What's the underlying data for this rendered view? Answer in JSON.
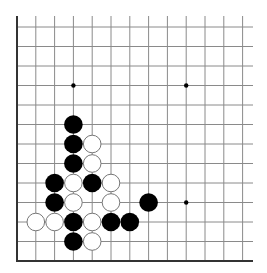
{
  "board": {
    "type": "go-board-fragment",
    "visible_columns": 13,
    "visible_rows": 13,
    "edges": [
      "left",
      "bottom"
    ],
    "origin": "bottom-left",
    "colors": {
      "background": "#ffffff",
      "grid_line": "#8a8a8a",
      "edge_line": "#333333",
      "black_stone": "#000000",
      "white_stone_fill": "#ffffff",
      "white_stone_stroke": "#777777",
      "star_point": "#000000"
    },
    "star_points": [
      {
        "col": 3,
        "row": 9
      },
      {
        "col": 9,
        "row": 9
      },
      {
        "col": 9,
        "row": 3
      }
    ],
    "stones": [
      {
        "color": "black",
        "col": 3,
        "row": 7
      },
      {
        "color": "black",
        "col": 3,
        "row": 6
      },
      {
        "color": "white",
        "col": 4,
        "row": 6
      },
      {
        "color": "black",
        "col": 3,
        "row": 5
      },
      {
        "color": "white",
        "col": 4,
        "row": 5
      },
      {
        "color": "black",
        "col": 2,
        "row": 4
      },
      {
        "color": "white",
        "col": 3,
        "row": 4
      },
      {
        "color": "black",
        "col": 4,
        "row": 4
      },
      {
        "color": "white",
        "col": 5,
        "row": 4
      },
      {
        "color": "black",
        "col": 2,
        "row": 3
      },
      {
        "color": "white",
        "col": 3,
        "row": 3
      },
      {
        "color": "white",
        "col": 5,
        "row": 3
      },
      {
        "color": "black",
        "col": 7,
        "row": 3
      },
      {
        "color": "white",
        "col": 1,
        "row": 2
      },
      {
        "color": "white",
        "col": 2,
        "row": 2
      },
      {
        "color": "black",
        "col": 3,
        "row": 2
      },
      {
        "color": "white",
        "col": 4,
        "row": 2
      },
      {
        "color": "black",
        "col": 5,
        "row": 2
      },
      {
        "color": "black",
        "col": 6,
        "row": 2
      },
      {
        "color": "black",
        "col": 3,
        "row": 1
      },
      {
        "color": "white",
        "col": 4,
        "row": 1
      }
    ]
  }
}
